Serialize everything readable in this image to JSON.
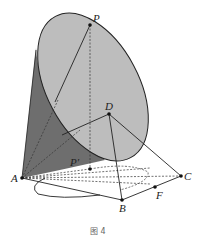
{
  "figure": {
    "caption": "图 4",
    "colors": {
      "background": "#ffffff",
      "cone_dark": "#6e6e6e",
      "ellipse_light": "#bdbdbd",
      "stroke": "#222222",
      "dashed": "#333333"
    },
    "points": {
      "P": {
        "label": "P",
        "x": 90,
        "y": 25
      },
      "D": {
        "label": "D",
        "x": 109,
        "y": 114
      },
      "A": {
        "label": "A",
        "x": 22,
        "y": 178
      },
      "P1": {
        "label": "P′",
        "x": 90,
        "y": 169
      },
      "B": {
        "label": "B",
        "x": 122,
        "y": 200
      },
      "C": {
        "label": "C",
        "x": 181,
        "y": 176
      },
      "F": {
        "label": "F",
        "x": 155,
        "y": 187
      }
    }
  }
}
